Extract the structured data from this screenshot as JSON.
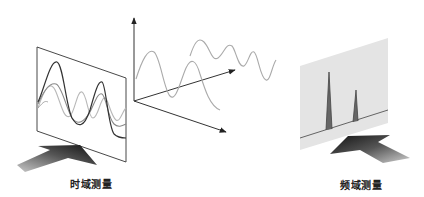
{
  "diagram": {
    "time_domain": {
      "label": "时域测量",
      "panel": {
        "fill": "#ffffff",
        "stroke": "#333333"
      },
      "waves": [
        "dark composite",
        "mid-gray sine",
        "light-gray sine"
      ]
    },
    "axes": {
      "description": "3D axes with decomposed sine waves",
      "stroke": "#333333",
      "wave_color": "#aaaaaa"
    },
    "frequency_domain": {
      "label": "频域测量",
      "panel": {
        "fill": "#e4e4e4"
      },
      "peaks": [
        {
          "name": "peak-1",
          "relative_height": 1.0
        },
        {
          "name": "peak-2",
          "relative_height": 0.6
        }
      ]
    },
    "colors": {
      "arrow_dark": "#222222",
      "arrow_light": "#bbbbbb",
      "line": "#333333"
    }
  }
}
